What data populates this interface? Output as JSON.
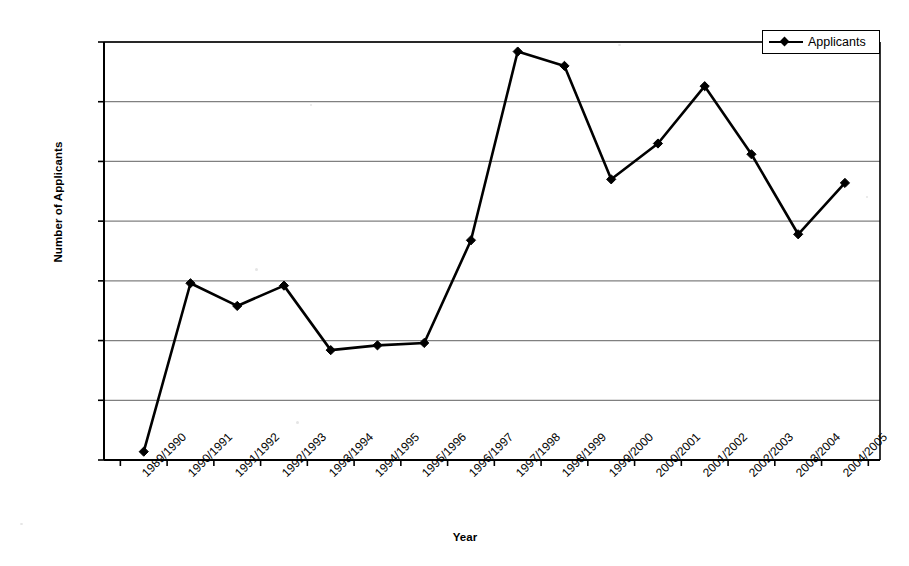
{
  "chart_data": {
    "type": "line",
    "title": "",
    "xlabel": "Year",
    "ylabel": "Number of Applicants",
    "categories": [
      "1989/1990",
      "1990/1991",
      "1991/1992",
      "1992/1993",
      "1993/1994",
      "1994/1995",
      "1995/1996",
      "1996/1997",
      "1997/1998",
      "1998/1999",
      "1999/2000",
      "2000/2001",
      "2001/2002",
      "2002/2003",
      "2003/2004",
      "2004/2005"
    ],
    "series": [
      {
        "name": "Applicants",
        "values": [
          25700,
          39800,
          37900,
          39600,
          34200,
          34600,
          34800,
          43400,
          59200,
          58000,
          48500,
          51500,
          56300,
          50600,
          43900,
          48200
        ]
      }
    ],
    "ylim": [
      25000,
      60000
    ],
    "ytick_values": [
      25000,
      30000,
      35000,
      40000,
      45000,
      50000,
      55000,
      60000
    ],
    "ytick_labels": [
      "25,000",
      "30,000",
      "35,000",
      "40,000",
      "45,000",
      "50,000",
      "55,000",
      "60,000"
    ],
    "grid": "horizontal",
    "legend_position": "top-right",
    "legend_entries": [
      "Applicants"
    ],
    "marker": "diamond",
    "line_color": "#000000",
    "grid_color": "#808080",
    "axis_color": "#000000",
    "background_color": "#ffffff"
  },
  "legend": {
    "applicants_label": "Applicants"
  },
  "axes": {
    "y_title": "Number of Applicants",
    "x_title": "Year"
  }
}
